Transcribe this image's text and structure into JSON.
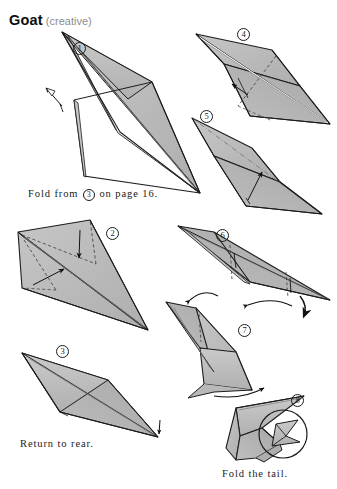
{
  "page": {
    "width": 337,
    "height": 489,
    "background": "#ffffff",
    "model_name": "Goat",
    "model_qualifier": "(creative)"
  },
  "title": {
    "main": "Goat",
    "sub": "(creative)",
    "main_color": "#0d0d0d",
    "sub_color": "#8d8d8d"
  },
  "colors": {
    "paper_fill": "#b5b5b5",
    "paper_fill_light": "#c4c4c4",
    "paper_fill_dark": "#a2a2a2",
    "paper_back": "#ffffff",
    "outline": "#1c1c1c",
    "fold_line": "#3a3a3a",
    "arrow": "#111111",
    "text": "#1a1a1a"
  },
  "captions": [
    {
      "id": "fold-from",
      "prefix": "Fold from",
      "circled": "3",
      "suffix": "on page 16.",
      "full_text": "Fold from ③ on page 16.",
      "x": 28,
      "y": 188
    },
    {
      "id": "return-to-rear",
      "prefix": "Return to rear.",
      "circled": "",
      "suffix": "",
      "full_text": "Return to rear.",
      "x": 20,
      "y": 438
    },
    {
      "id": "fold-the-tail",
      "prefix": "Fold the tail.",
      "circled": "",
      "suffix": "",
      "full_text": "Fold the tail.",
      "x": 222,
      "y": 468
    }
  ],
  "steps": [
    {
      "number": "1",
      "label": "①",
      "x": 73,
      "y": 42,
      "panel": "step-1",
      "note": "large kite with open white gap, pull-out arrow at left"
    },
    {
      "number": "2",
      "label": "②",
      "x": 106,
      "y": 227,
      "panel": "step-2",
      "note": "kite with dashed valley folds and two straight arrows"
    },
    {
      "number": "3",
      "label": "③",
      "x": 56,
      "y": 345,
      "panel": "step-3",
      "note": "narrow rhombus, small arrow at right tip"
    },
    {
      "number": "4",
      "label": "④",
      "x": 237,
      "y": 28,
      "panel": "step-4",
      "note": "rhombus with dashed diagonal and arrow"
    },
    {
      "number": "5",
      "label": "⑤",
      "x": 200,
      "y": 110,
      "panel": "step-5",
      "note": "rhombus with dash-dot fold and arrow"
    },
    {
      "number": "6",
      "label": "⑥",
      "x": 216,
      "y": 229,
      "panel": "step-6",
      "note": "narrow triangle, vertical dashed lines, curved arrows"
    },
    {
      "number": "7",
      "label": "⑦",
      "x": 238,
      "y": 324,
      "panel": "step-7",
      "note": "folded leg form with curved arrow"
    },
    {
      "number": "8",
      "label": "⑧",
      "x": 291,
      "y": 394,
      "panel": "step-8",
      "note": "finished goat with magnifier inset circle on tail"
    }
  ],
  "diagram": {
    "kind": "origami-instruction-sheet",
    "step_count": 8,
    "line_styles": [
      "solid-outline",
      "dashed-valley-fold",
      "dash-dot-mountain-fold"
    ],
    "arrow_types": [
      "straight-fold-arrow",
      "curved-fold-arrow",
      "pull-out-arrow"
    ]
  }
}
